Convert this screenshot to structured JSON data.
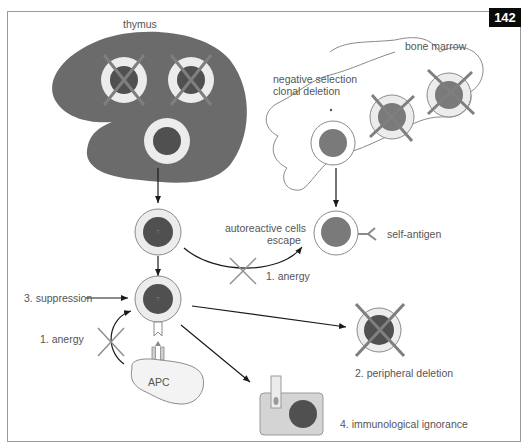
{
  "figure": {
    "page_number": "142",
    "labels": {
      "thymus": "thymus",
      "bone_marrow": "bone marrow",
      "negative_selection_line1": "negative selection",
      "negative_selection_line2": "clonal deletion",
      "autoreactive_line1": "autoreactive cells",
      "autoreactive_line2": "escape",
      "self_antigen": "self-antigen",
      "anergy_b": "1. anergy",
      "anergy_apc": "1. anergy",
      "suppression": "3. suppression",
      "apc": "APC",
      "peripheral_deletion": "2. peripheral deletion",
      "immunological_ignorance": "4. immunological ignorance"
    },
    "cell_letters": {
      "t_cell": "T",
      "b_cell": "B"
    },
    "colors": {
      "thymus_fill": "#6b6b6b",
      "nucleus_dark": "#505050",
      "nucleus_mid": "#7a7a7a",
      "ring_light": "#e6e6e6",
      "cross": "#7f7f7f",
      "arrow": "#1a1a1a",
      "frame": "#9a9a9a",
      "ignorance_box": "#d4d4d4"
    }
  }
}
